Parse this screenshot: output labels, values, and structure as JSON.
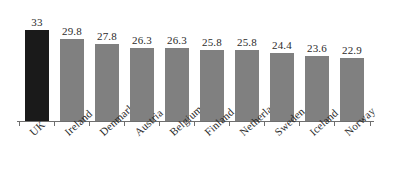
{
  "chart_data": {
    "type": "bar",
    "title": "",
    "subtitle": "",
    "xlabel": "",
    "ylabel": "",
    "categories": [
      "UK",
      "Ireland",
      "Denmark",
      "Austria",
      "Belgium",
      "Finland",
      "Netherlands",
      "Sweden",
      "Iceland",
      "Norway"
    ],
    "values": [
      33,
      29.8,
      27.8,
      26.3,
      26.3,
      25.8,
      25.8,
      24.4,
      23.6,
      22.9
    ],
    "value_labels": [
      "33",
      "29.8",
      "27.8",
      "26.3",
      "26.3",
      "25.8",
      "25.8",
      "24.4",
      "23.6",
      "22.9"
    ],
    "ylim": [
      0,
      36.5
    ],
    "grid": false,
    "legend": null,
    "legend_position": "none",
    "highlight_index": 0,
    "colors": {
      "highlight_bar": "#1a1a1a",
      "bar": "#808080",
      "axis": "#6e6e6e",
      "text": "#2b2b2b",
      "background": "#ffffff"
    }
  },
  "axis": {
    "tick_count": 11,
    "show_y_axis": false,
    "show_x_axis": true
  }
}
